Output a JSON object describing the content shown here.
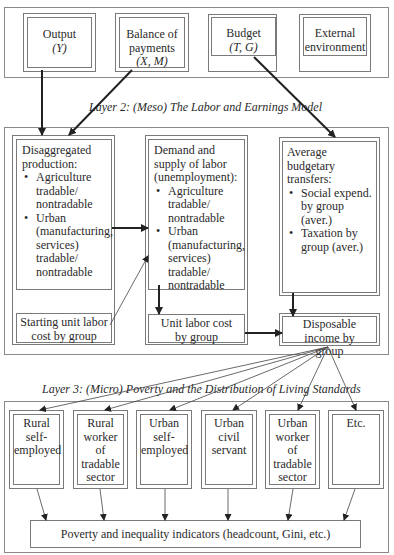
{
  "layer1": {
    "boxes": [
      {
        "id": "output",
        "title": "Output",
        "symbol": "(Y)"
      },
      {
        "id": "balance",
        "title": "Balance of",
        "title2": "payments",
        "symbol": "(X, M)"
      },
      {
        "id": "budget",
        "title": "Budget",
        "symbol": "(T, G)"
      },
      {
        "id": "external",
        "title": "External",
        "title2": "environment"
      }
    ]
  },
  "layer2": {
    "title": "Layer 2: (Meso) The Labor and Earnings Model",
    "disaggregated": {
      "heading": "Disaggregated production:",
      "items": [
        "Agriculture tradable/ nontradable",
        "Urban (manufacturing, services) tradable/ nontradable"
      ]
    },
    "labor": {
      "heading": "Demand and supply of labor (unemployment):",
      "items": [
        "Agriculture tradable/ nontradable",
        "Urban (manufacturing, services) tradable/ nontradable"
      ]
    },
    "transfers": {
      "heading": "Average budgetary transfers:",
      "items": [
        "Social expend. by group (aver.)",
        "Taxation by group (aver.)"
      ]
    },
    "starting_cost": "Starting unit labor cost by group",
    "unit_cost": "Unit labor cost by group",
    "disposable": "Disposable income by group"
  },
  "layer3": {
    "title": "Layer 3: (Micro) Poverty and the Distribution of Living Standards",
    "groups": [
      {
        "label": "Rural self- employed"
      },
      {
        "label": "Rural worker of tradable sector"
      },
      {
        "label": "Urban self- employed"
      },
      {
        "label": "Urban civil servant"
      },
      {
        "label": "Urban worker of tradable sector"
      },
      {
        "label": "Etc."
      }
    ],
    "indicators": "Poverty and inequality indicators (headcount, Gini, etc.)"
  },
  "colors": {
    "line": "#7a7a7a",
    "arrow": "#222222",
    "text": "#2a2a2a"
  }
}
